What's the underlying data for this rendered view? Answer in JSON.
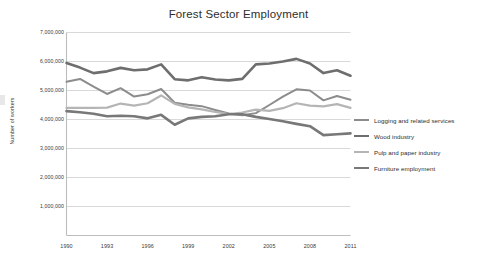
{
  "chart_data": {
    "type": "line",
    "title": "Forest Sector Employment",
    "xlabel": "",
    "ylabel": "Number of workers",
    "xlim": [
      1990,
      2011
    ],
    "ylim": [
      0,
      7000000
    ],
    "grid": true,
    "legend_position": "right",
    "xticks": [
      "1990",
      "1993",
      "1996",
      "1999",
      "2002",
      "2005",
      "2008",
      "2011"
    ],
    "yticks": [
      "1,000,000",
      "2,000,000",
      "3,000,000",
      "4,000,000",
      "5,000,000",
      "6,000,000",
      "7,000,000"
    ],
    "ytick_values": [
      1000000,
      2000000,
      3000000,
      4000000,
      5000000,
      6000000,
      7000000
    ],
    "x": [
      1990,
      1991,
      1992,
      1993,
      1994,
      1995,
      1996,
      1997,
      1998,
      1999,
      2000,
      2001,
      2002,
      2003,
      2004,
      2005,
      2006,
      2007,
      2008,
      2009,
      2010,
      2011
    ],
    "series": [
      {
        "name": "Logging and related services",
        "color": "#8c8c8c",
        "width": 2.0,
        "values": [
          5300000,
          5400000,
          5130000,
          4880000,
          5080000,
          4790000,
          4870000,
          5050000,
          4580000,
          4510000,
          4460000,
          4330000,
          4210000,
          4150000,
          4220000,
          4500000,
          4790000,
          5040000,
          5000000,
          4660000,
          4810000,
          4680000
        ]
      },
      {
        "name": "Wood industry",
        "color": "#6e6e6e",
        "width": 2.6,
        "values": [
          5950000,
          5790000,
          5600000,
          5660000,
          5780000,
          5700000,
          5730000,
          5900000,
          5390000,
          5350000,
          5460000,
          5380000,
          5350000,
          5400000,
          5900000,
          5930000,
          6000000,
          6090000,
          5930000,
          5600000,
          5700000,
          5510000
        ]
      },
      {
        "name": "Pulp and paper industry",
        "color": "#b5b5b5",
        "width": 2.2,
        "values": [
          4400000,
          4400000,
          4400000,
          4410000,
          4550000,
          4480000,
          4560000,
          4830000,
          4540000,
          4420000,
          4350000,
          4260000,
          4190000,
          4240000,
          4340000,
          4300000,
          4390000,
          4560000,
          4480000,
          4450000,
          4530000,
          4400000
        ]
      },
      {
        "name": "Furniture employment",
        "color": "#787878",
        "width": 2.6,
        "values": [
          4290000,
          4250000,
          4200000,
          4110000,
          4130000,
          4110000,
          4040000,
          4160000,
          3820000,
          4040000,
          4090000,
          4110000,
          4180000,
          4180000,
          4090000,
          4020000,
          3940000,
          3850000,
          3770000,
          3460000,
          3490000,
          3520000
        ]
      }
    ]
  },
  "legend": {
    "items": [
      {
        "label": "Logging and related services",
        "color": "#8c8c8c"
      },
      {
        "label": "Wood industry",
        "color": "#6e6e6e"
      },
      {
        "label": "Pulp and paper industry",
        "color": "#b5b5b5"
      },
      {
        "label": "Furniture employment",
        "color": "#787878"
      }
    ]
  },
  "colors": {
    "grid": "#d9d9d9",
    "axis": "#bdbdbd",
    "text": "#3a3a3a",
    "background": "#ffffff"
  }
}
